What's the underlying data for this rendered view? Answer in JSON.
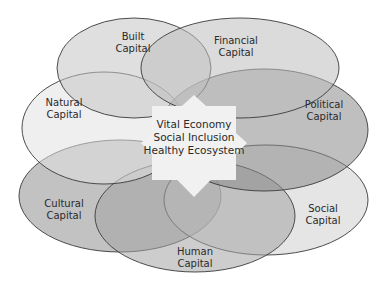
{
  "diagram": {
    "type": "overlapping-ellipses",
    "center": {
      "lines": [
        "Vital Economy",
        "Social Inclusion",
        "Healthy Ecosystem"
      ]
    },
    "capitals": [
      {
        "id": "built",
        "line1": "Built",
        "line2": "Capital",
        "fill": "#cfcfcf"
      },
      {
        "id": "financial",
        "line1": "Financial",
        "line2": "Capital",
        "fill": "#c9c9c9"
      },
      {
        "id": "natural",
        "line1": "Natural",
        "line2": "Capital",
        "fill": "#e4e4e4"
      },
      {
        "id": "political",
        "line1": "Political",
        "line2": "Capital",
        "fill": "#a9a9a9"
      },
      {
        "id": "cultural",
        "line1": "Cultural",
        "line2": "Capital",
        "fill": "#a8a8a8"
      },
      {
        "id": "social",
        "line1": "Social",
        "line2": "Capital",
        "fill": "#d6d6d6"
      },
      {
        "id": "human",
        "line1": "Human",
        "line2": "Capital",
        "fill": "#b8b8b8"
      }
    ],
    "colors": {
      "outline": "#3a3a3a",
      "star_fill": "#f2f2f2",
      "background": "#ffffff"
    }
  }
}
